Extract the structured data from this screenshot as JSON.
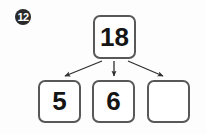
{
  "problem": {
    "number": "12",
    "marker_style": "filled-circle-white-text"
  },
  "diagram": {
    "type": "number-bond",
    "title": "",
    "whole": {
      "label": "18",
      "value": 18,
      "filled": true
    },
    "parts": [
      {
        "label": "5",
        "value": 5,
        "filled": true
      },
      {
        "label": "6",
        "value": 6,
        "filled": true
      },
      {
        "label": "",
        "value": null,
        "filled": false
      }
    ],
    "arrows": [
      {
        "from": "whole",
        "to": "part-1",
        "direction": "down-left"
      },
      {
        "from": "whole",
        "to": "part-2",
        "direction": "down"
      },
      {
        "from": "whole",
        "to": "part-3",
        "direction": "down-right"
      }
    ]
  },
  "colors": {
    "background": "#fdfdfd",
    "box_border": "#585858",
    "box_fill": "#ffffff",
    "text": "#151515",
    "marker_fill": "#2a2a2a",
    "marker_text": "#ffffff",
    "arrow": "#2f2f2f"
  }
}
